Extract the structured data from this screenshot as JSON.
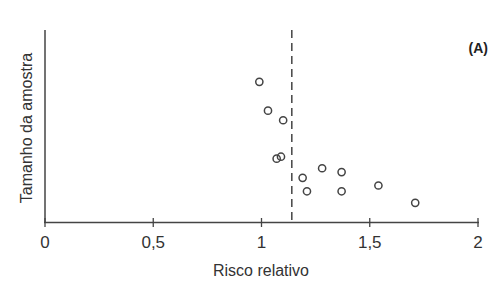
{
  "chart_data": {
    "type": "scatter",
    "title": "",
    "panel_label": "(A)",
    "xlabel": "Risco relativo",
    "ylabel": "Tamanho da amostra",
    "xlim": [
      0,
      2
    ],
    "ylim": [
      0,
      100
    ],
    "x_ticks": [
      0,
      0.5,
      1,
      1.5,
      2
    ],
    "x_tick_labels": [
      "0",
      "0,5",
      "1",
      "1,5",
      "2"
    ],
    "y_ticks": [],
    "grid": false,
    "legend": null,
    "reference_line": {
      "x": 1.14,
      "style": "dashed"
    },
    "points": [
      {
        "x": 0.99,
        "y": 73
      },
      {
        "x": 1.03,
        "y": 58
      },
      {
        "x": 1.1,
        "y": 53
      },
      {
        "x": 1.07,
        "y": 33
      },
      {
        "x": 1.09,
        "y": 34
      },
      {
        "x": 1.19,
        "y": 23
      },
      {
        "x": 1.21,
        "y": 16
      },
      {
        "x": 1.28,
        "y": 28
      },
      {
        "x": 1.37,
        "y": 26
      },
      {
        "x": 1.37,
        "y": 16
      },
      {
        "x": 1.54,
        "y": 19
      },
      {
        "x": 1.71,
        "y": 10
      }
    ],
    "marker": "open-circle",
    "colors": {
      "axis": "#444444",
      "marker": "#444444"
    }
  }
}
